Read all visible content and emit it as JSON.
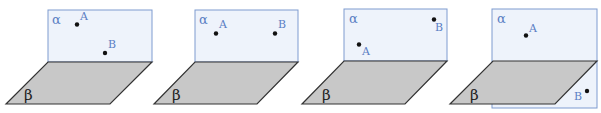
{
  "diagram": {
    "colors": {
      "alpha_fill": "#eef3fb",
      "alpha_stroke": "#7e9bd0",
      "beta_fill": "#c8c8c8",
      "beta_stroke": "#333333",
      "label_blue": "#5b7fc4",
      "point": "#111111"
    },
    "panels": [
      {
        "alpha_label": "α",
        "beta_label": "β",
        "point_a_label": "A",
        "point_b_label": "B"
      },
      {
        "alpha_label": "α",
        "beta_label": "β",
        "point_a_label": "A",
        "point_b_label": "B"
      },
      {
        "alpha_label": "α",
        "beta_label": "β",
        "point_a_label": "A",
        "point_b_label": "B"
      },
      {
        "alpha_label": "α",
        "beta_label": "β",
        "point_a_label": "A",
        "point_b_label": "B"
      }
    ]
  }
}
